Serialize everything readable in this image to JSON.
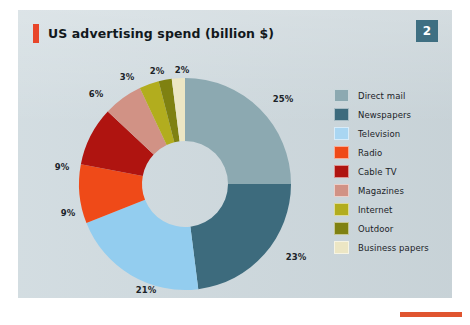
{
  "header": {
    "title": "US advertising spend (billion $)",
    "page_number": "2",
    "accent_color": "#e8462a",
    "badge_color": "#3f6f82"
  },
  "footer": {
    "accent_color": "#e0552f"
  },
  "chart_data": {
    "type": "pie",
    "variant": "donut",
    "title": "US advertising spend (billion $)",
    "xlabel": "",
    "ylabel": "",
    "unit": "%",
    "legend_position": "right",
    "grid": false,
    "start_angle_deg": 0,
    "direction": "clockwise",
    "inner_radius_ratio": 0.4,
    "categories": [
      "Direct mail",
      "Newspapers",
      "Television",
      "Radio",
      "Cable TV",
      "Magazines",
      "Internet",
      "Outdoor",
      "Business papers"
    ],
    "values": [
      25,
      23,
      21,
      9,
      9,
      6,
      3,
      2,
      2
    ],
    "data_labels": [
      "25%",
      "23%",
      "21%",
      "9%",
      "9%",
      "6%",
      "3%",
      "2%",
      "2%"
    ],
    "colors": [
      "#8ca9b1",
      "#3d6b7d",
      "#93cdef",
      "#ef4a18",
      "#af1410",
      "#d19285",
      "#b2ad1e",
      "#7f8111",
      "#ece6c4"
    ]
  },
  "labels": [
    {
      "text": "25%",
      "x": 265,
      "y": 51
    },
    {
      "text": "23%",
      "x": 278,
      "y": 209
    },
    {
      "text": "21%",
      "x": 128,
      "y": 242
    },
    {
      "text": "9%",
      "x": 50,
      "y": 165
    },
    {
      "text": "9%",
      "x": 44,
      "y": 119
    },
    {
      "text": "6%",
      "x": 78,
      "y": 46
    },
    {
      "text": "3%",
      "x": 109,
      "y": 29
    },
    {
      "text": "2%",
      "x": 139,
      "y": 23
    },
    {
      "text": "2%",
      "x": 164,
      "y": 22
    }
  ],
  "legend": {
    "items": [
      {
        "label": "Direct mail",
        "color": "#8ca9b1"
      },
      {
        "label": "Newspapers",
        "color": "#3d6b7d"
      },
      {
        "label": "Television",
        "color": "#a9d6f2"
      },
      {
        "label": "Radio",
        "color": "#ef4a18"
      },
      {
        "label": "Cable TV",
        "color": "#af1410"
      },
      {
        "label": "Magazines",
        "color": "#d19285"
      },
      {
        "label": "Internet",
        "color": "#b2ad1e"
      },
      {
        "label": "Outdoor",
        "color": "#7f8111"
      },
      {
        "label": "Business papers",
        "color": "#ece6c4"
      }
    ]
  }
}
